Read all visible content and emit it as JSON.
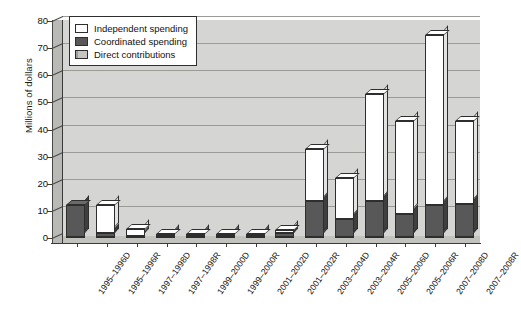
{
  "chart_data": {
    "type": "bar",
    "title": "",
    "subtitle": "",
    "xlabel": "",
    "ylabel": "Millions of dollars",
    "ylim": [
      0,
      80
    ],
    "yticks": [
      0,
      10,
      20,
      30,
      40,
      50,
      60,
      70,
      80
    ],
    "grid": true,
    "stacked": true,
    "three_d": true,
    "legend_position": "top-left",
    "categories": [
      "1995–1996D",
      "1995–1996R",
      "1997–1998D",
      "1997–1998R",
      "1999–2000D",
      "1999–2000R",
      "2001–2002D",
      "2001–2002R",
      "2003–2004D",
      "2003–2004R",
      "2005–2006D",
      "2005–2006R",
      "2007–2008D",
      "2007–2008R"
    ],
    "series": [
      {
        "name": "Direct contributions",
        "color": "#a7a7a5",
        "values": [
          0.5,
          0.5,
          0.4,
          0.4,
          0.4,
          0.4,
          0.4,
          0.4,
          0.5,
          0.5,
          0.5,
          0.5,
          0.5,
          0.5
        ]
      },
      {
        "name": "Coordinated spending",
        "color": "#585858",
        "values": [
          11.5,
          1.5,
          0.5,
          0.5,
          0.5,
          0.5,
          0.5,
          1.5,
          13.0,
          6.5,
          13.0,
          8.5,
          11.5,
          12.0
        ]
      },
      {
        "name": "Independent spending",
        "color": "#ffffff",
        "values": [
          0.0,
          10.0,
          2.6,
          0.6,
          0.6,
          0.6,
          0.6,
          1.1,
          19.5,
          15.0,
          39.5,
          34.0,
          63.0,
          30.5
        ]
      }
    ],
    "totals": [
      12.0,
      12.0,
      3.5,
      1.5,
      1.5,
      1.5,
      1.5,
      3.0,
      33.0,
      22.0,
      53.0,
      43.0,
      75.0,
      43.0
    ]
  },
  "legend": {
    "items": [
      {
        "label": "Independent spending",
        "key": "indep"
      },
      {
        "label": "Coordinated spending",
        "key": "coord"
      },
      {
        "label": "Direct contributions",
        "key": "direct"
      }
    ]
  }
}
